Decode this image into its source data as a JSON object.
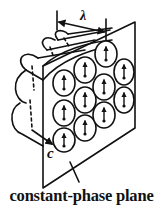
{
  "diagram": {
    "labels": {
      "wavelength": "λ",
      "direction": "c",
      "caption": "constant-phase plane"
    },
    "colors": {
      "stroke": "#111111",
      "background": "#ffffff"
    },
    "elements": {
      "cylinders_rows": 3,
      "circle_grid_count": 11,
      "arrow_direction": "up"
    }
  }
}
